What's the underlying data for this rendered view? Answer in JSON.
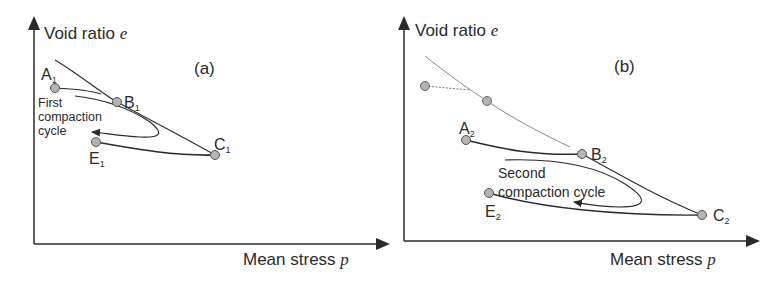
{
  "panels": [
    {
      "tag": "(a)",
      "y_axis_label": "Void ratio",
      "y_axis_symbol": "e",
      "x_axis_label": "Mean stress",
      "x_axis_symbol": "p",
      "points": {
        "A": {
          "label": "A",
          "sub": "1"
        },
        "B": {
          "label": "B",
          "sub": "1"
        },
        "C": {
          "label": "C",
          "sub": "1"
        },
        "E": {
          "label": "E",
          "sub": "1"
        }
      },
      "cycle_label": [
        "First",
        "compaction",
        "cycle"
      ]
    },
    {
      "tag": "(b)",
      "y_axis_label": "Void ratio",
      "y_axis_symbol": "e",
      "x_axis_label": "Mean stress",
      "x_axis_symbol": "p",
      "points": {
        "A": {
          "label": "A",
          "sub": "2"
        },
        "B": {
          "label": "B",
          "sub": "2"
        },
        "C": {
          "label": "C",
          "sub": "2"
        },
        "E": {
          "label": "E",
          "sub": "2"
        }
      },
      "cycle_label": [
        "Second",
        "compaction cycle"
      ]
    }
  ],
  "colors": {
    "ink": "#2a2a2a",
    "marker_fill": "#b4b4b4",
    "faded": "#7a7a7a"
  }
}
